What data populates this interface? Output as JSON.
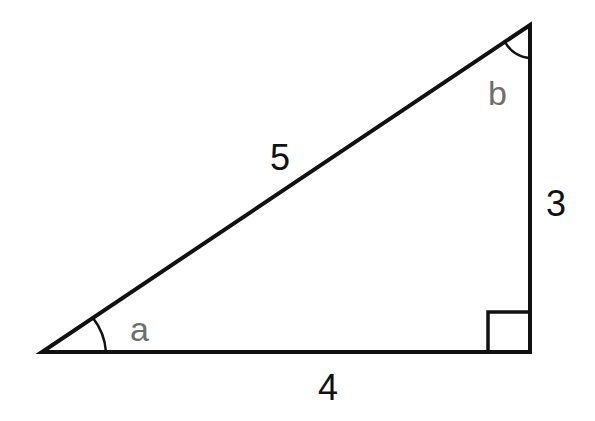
{
  "diagram": {
    "type": "right-triangle",
    "colors": {
      "stroke": "#111111",
      "side_label": "#111111",
      "angle_label": "#6e6e6e",
      "background": "#ffffff"
    },
    "vertices": {
      "left": [
        42,
        352
      ],
      "right_angle": [
        530,
        352
      ],
      "top": [
        530,
        25
      ]
    },
    "sides": {
      "hypotenuse": "5",
      "base": "4",
      "height": "3"
    },
    "angles": {
      "left": "a",
      "top": "b",
      "right_angle_marker": true
    }
  }
}
